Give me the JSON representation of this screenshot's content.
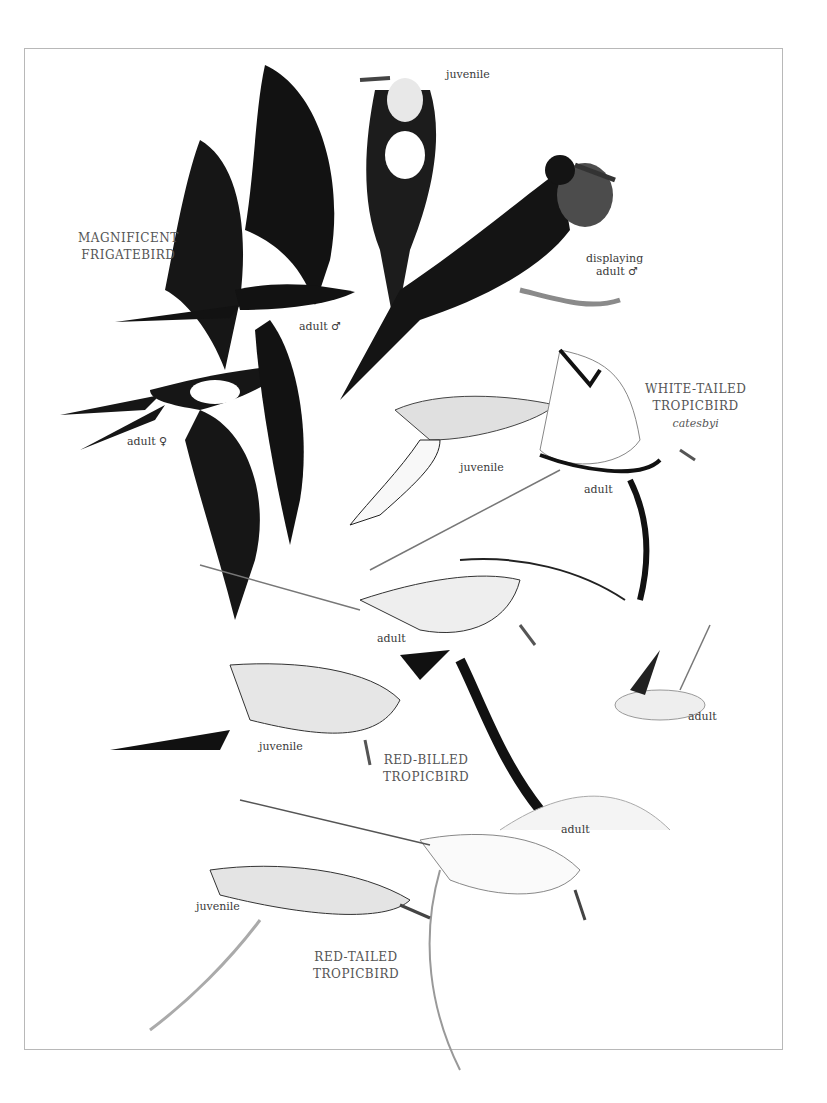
{
  "plate": {
    "species": [
      {
        "name_line1": "MAGNIFICENT",
        "name_line2": "FRIGATEBIRD"
      },
      {
        "name_line1": "WHITE-TAILED",
        "name_line2": "TROPICBIRD",
        "subspecies": "catesbyi"
      },
      {
        "name_line1": "RED-BILLED",
        "name_line2": "TROPICBIRD"
      },
      {
        "name_line1": "RED-TAILED",
        "name_line2": "TROPICBIRD"
      }
    ],
    "labels": {
      "frig_juvenile": "juvenile",
      "frig_display_1": "displaying",
      "frig_display_2": "adult ♂",
      "frig_adult_male": "adult ♂",
      "frig_adult_female": "adult ♀",
      "wt_juvenile": "juvenile",
      "wt_adult": "adult",
      "rb_adult": "adult",
      "rb_juvenile": "juvenile",
      "rb_adult_sitting": "adult",
      "rt_adult": "adult",
      "rt_juvenile": "juvenile"
    },
    "colors": {
      "frigatebird": "#151515",
      "pouch": "#4a4a4a",
      "tropicbird": "#f4f4f4",
      "barring": "#2a2a2a"
    }
  }
}
